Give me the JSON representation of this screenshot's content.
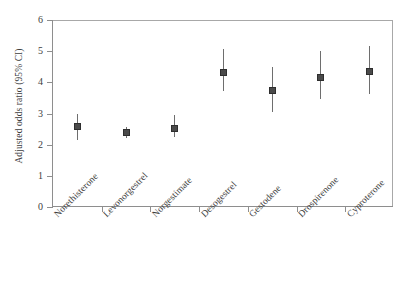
{
  "chart_data": {
    "type": "scatter",
    "title": "",
    "subtitle": "",
    "xlabel": "",
    "ylabel": "Adjusted odds ratio (95% CI)",
    "ylim": [
      0,
      6
    ],
    "yticks": [
      0,
      1,
      2,
      3,
      4,
      5,
      6
    ],
    "ytick_labels": [
      "0",
      "1",
      "2",
      "3",
      "4",
      "5",
      "6"
    ],
    "grid": false,
    "legend": null,
    "categories": [
      "Norethisterone",
      "Levonorgestrel",
      "Norgestimate",
      "Desogestrel",
      "Gestodene",
      "Drospirenone",
      "Cyproterone"
    ],
    "series": [
      {
        "name": "Adjusted odds ratio",
        "values": [
          2.57,
          2.38,
          2.53,
          4.31,
          3.74,
          4.16,
          4.34
        ],
        "ci_lower": [
          2.15,
          2.21,
          2.25,
          3.71,
          3.05,
          3.46,
          3.62
        ],
        "ci_upper": [
          2.99,
          2.58,
          2.94,
          5.06,
          4.49,
          5.02,
          5.15
        ],
        "marker": "square",
        "marker_color": "#4a4a4a",
        "line_color": "#6e6e6e"
      }
    ],
    "annotations": []
  },
  "axes": {
    "y_title": "Adjusted odds ratio (95% CI)",
    "y_tick_labels": [
      "0",
      "1",
      "2",
      "3",
      "4",
      "5",
      "6"
    ],
    "x_tick_labels": [
      "Norethisterone",
      "Levonorgestrel",
      "Norgestimate",
      "Desogestrel",
      "Gestodene",
      "Drospirenone",
      "Cyproterone"
    ]
  },
  "colors": {
    "axis": "#8e8e8e",
    "frame": "#a8a8a8",
    "marker": "#4a4a4a",
    "whisker": "#6e6e6e",
    "text": "#3d3d3d",
    "background": "#ffffff"
  }
}
